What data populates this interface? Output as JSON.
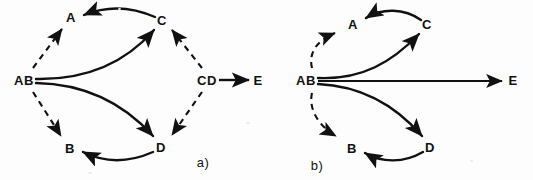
{
  "figure": {
    "caption_a": "a)",
    "caption_b": "b)",
    "ink_color": "#111111",
    "background_color": "#fdfdfd"
  },
  "panel_a": {
    "id": "a",
    "caption": "a)",
    "nodes": [
      {
        "id": "AB",
        "label": "AB",
        "x": 24,
        "y": 80
      },
      {
        "id": "A",
        "label": "A",
        "x": 71,
        "y": 17
      },
      {
        "id": "C",
        "label": "C",
        "x": 162,
        "y": 20
      },
      {
        "id": "CD",
        "label": "CD",
        "x": 207,
        "y": 80
      },
      {
        "id": "E",
        "label": "E",
        "x": 258,
        "y": 80
      },
      {
        "id": "B",
        "label": "B",
        "x": 70,
        "y": 148
      },
      {
        "id": "D",
        "label": "D",
        "x": 161,
        "y": 147
      }
    ],
    "edges": [
      {
        "from": "AB",
        "to": "A",
        "style": "dashed",
        "shape": "straight"
      },
      {
        "from": "AB",
        "to": "B",
        "style": "dashed",
        "shape": "straight"
      },
      {
        "from": "AB",
        "to": "C",
        "style": "solid",
        "shape": "curved"
      },
      {
        "from": "AB",
        "to": "D",
        "style": "solid",
        "shape": "curved"
      },
      {
        "from": "C",
        "to": "A",
        "style": "solid",
        "shape": "curved"
      },
      {
        "from": "D",
        "to": "B",
        "style": "solid",
        "shape": "curved"
      },
      {
        "from": "CD",
        "to": "C",
        "style": "dashed",
        "shape": "straight"
      },
      {
        "from": "CD",
        "to": "D",
        "style": "dashed",
        "shape": "straight"
      },
      {
        "from": "CD",
        "to": "E",
        "style": "solid",
        "shape": "straight"
      }
    ]
  },
  "panel_b": {
    "id": "b",
    "caption": "b)",
    "nodes": [
      {
        "id": "AB",
        "label": "AB",
        "x": 306,
        "y": 80
      },
      {
        "id": "A",
        "label": "A",
        "x": 353,
        "y": 24
      },
      {
        "id": "C",
        "label": "C",
        "x": 427,
        "y": 24
      },
      {
        "id": "E",
        "label": "E",
        "x": 513,
        "y": 80
      },
      {
        "id": "B",
        "label": "B",
        "x": 352,
        "y": 148
      },
      {
        "id": "D",
        "label": "D",
        "x": 430,
        "y": 147
      }
    ],
    "edges": [
      {
        "from": "AB",
        "to": "A",
        "style": "dashed",
        "shape": "curved"
      },
      {
        "from": "AB",
        "to": "B",
        "style": "dashed",
        "shape": "curved"
      },
      {
        "from": "AB",
        "to": "C",
        "style": "solid",
        "shape": "curved"
      },
      {
        "from": "AB",
        "to": "D",
        "style": "solid",
        "shape": "curved"
      },
      {
        "from": "C",
        "to": "A",
        "style": "solid",
        "shape": "curved"
      },
      {
        "from": "D",
        "to": "B",
        "style": "solid",
        "shape": "curved"
      },
      {
        "from": "AB",
        "to": "E",
        "style": "solid",
        "shape": "straight"
      }
    ]
  }
}
